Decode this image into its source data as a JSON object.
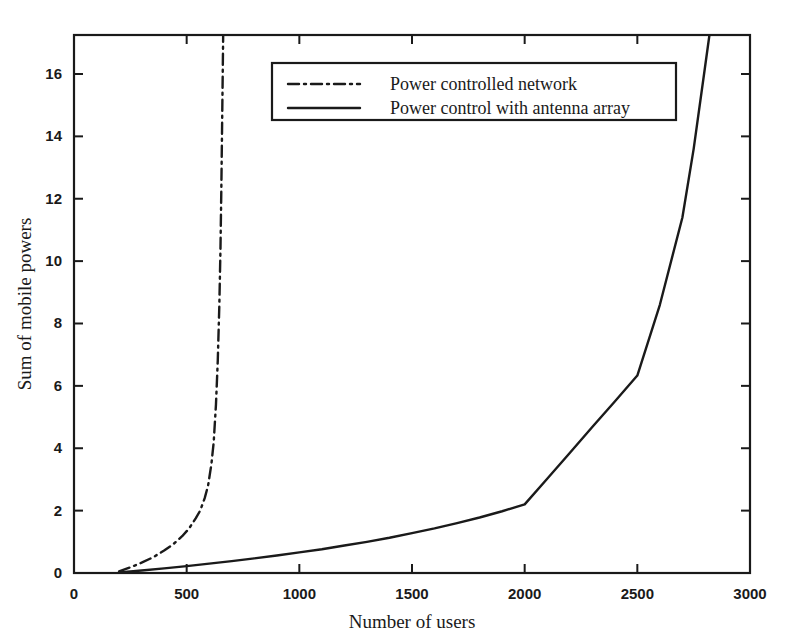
{
  "chart_data": {
    "type": "line",
    "title": "",
    "xlabel": "Number of users",
    "ylabel": "Sum of mobile powers",
    "xlim": [
      0,
      3000
    ],
    "ylim": [
      0,
      17.25
    ],
    "xticks": [
      0,
      500,
      1000,
      1500,
      2000,
      2500,
      3000
    ],
    "xtick_labels": [
      "0",
      "500",
      "1000",
      "1500",
      "2000",
      "2500",
      "3000"
    ],
    "yticks": [
      0,
      2,
      4,
      6,
      8,
      10,
      12,
      14,
      16
    ],
    "ytick_labels": [
      "0",
      "2",
      "4",
      "6",
      "8",
      "10",
      "12",
      "14",
      "16"
    ],
    "grid": false,
    "legend_position": "upper center",
    "line_color": "#1a1a1a",
    "background_color": "#ffffff",
    "series": [
      {
        "name": "Power controlled network",
        "style": "dash-dot",
        "x": [
          200,
          250,
          300,
          350,
          400,
          440,
          480,
          510,
          540,
          560,
          580,
          595,
          610,
          620,
          630,
          638,
          645,
          650,
          654,
          657,
          660,
          662
        ],
        "values": [
          0.05,
          0.18,
          0.33,
          0.5,
          0.72,
          0.92,
          1.18,
          1.42,
          1.75,
          2.0,
          2.4,
          2.8,
          3.5,
          4.2,
          5.4,
          6.8,
          8.6,
          10.4,
          12.4,
          14.2,
          16.0,
          17.25
        ]
      },
      {
        "name": "Power control with antenna array",
        "style": "solid",
        "x": [
          200,
          300,
          400,
          500,
          600,
          700,
          800,
          900,
          1000,
          1100,
          1200,
          1300,
          1400,
          1500,
          1600,
          1700,
          1800,
          1900,
          2000,
          2100,
          2200,
          2300,
          2400,
          2500,
          2600,
          2700,
          2750,
          2800,
          2820
        ],
        "values": [
          0.02,
          0.08,
          0.15,
          0.22,
          0.3,
          0.38,
          0.47,
          0.56,
          0.66,
          0.76,
          0.88,
          1.0,
          1.13,
          1.28,
          1.43,
          1.6,
          1.78,
          1.98,
          2.2,
          3.02,
          3.85,
          4.68,
          5.5,
          6.33,
          8.6,
          11.4,
          13.6,
          16.2,
          17.25
        ]
      }
    ]
  },
  "legend": {
    "entries": [
      {
        "label": "Power controlled network",
        "style": "dash-dot"
      },
      {
        "label": "Power control with antenna array",
        "style": "solid"
      }
    ]
  },
  "axes": {
    "x_title": "Number of users",
    "y_title": "Sum of mobile powers"
  }
}
